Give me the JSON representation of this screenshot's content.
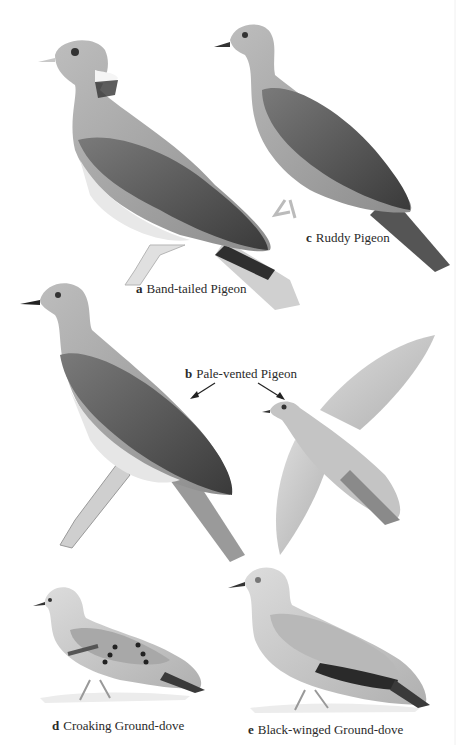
{
  "plate": {
    "colors": {
      "background": "#ffffff",
      "text": "#2a2a2a",
      "bird_light": "#c9c9c9",
      "bird_mid": "#9a9a9a",
      "bird_dark": "#5a5a5a",
      "bird_darkest": "#2e2e2e",
      "belly": "#e4e4e4"
    },
    "species": [
      {
        "letter": "a",
        "name": "Band-tailed Pigeon",
        "pose": "perched"
      },
      {
        "letter": "b",
        "name": "Pale-vented Pigeon",
        "pose": "perched and in flight",
        "arrows": 2
      },
      {
        "letter": "c",
        "name": "Ruddy Pigeon",
        "pose": "perched"
      },
      {
        "letter": "d",
        "name": "Croaking Ground-dove",
        "pose": "standing"
      },
      {
        "letter": "e",
        "name": "Black-winged Ground-dove",
        "pose": "standing"
      }
    ]
  }
}
